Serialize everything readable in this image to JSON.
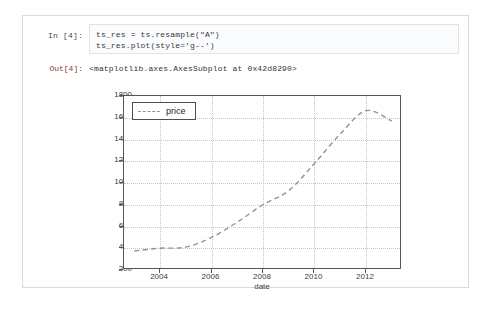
{
  "notebook": {
    "input_prompt": "In [4]:",
    "output_prompt": "Out[4]:",
    "code_line_1": "ts_res = ts.resample(\"A\")",
    "code_line_2": "ts_res.plot(style='g--')",
    "output_text": "<matplotlib.axes.AxesSubplot at 0x42d8290>"
  },
  "chart_data": {
    "type": "line",
    "title": "",
    "xlabel": "date",
    "ylabel": "",
    "legend": [
      "price"
    ],
    "legend_position": "upper-left",
    "grid": true,
    "line_style": "dashed",
    "line_color": "#7f9f86",
    "xlim": [
      2002.6,
      2013.4
    ],
    "ylim": [
      200,
      1800
    ],
    "ytick_labels": [
      "1800",
      "1600",
      "1400",
      "1200",
      "1000",
      "800",
      "600",
      "400",
      "200"
    ],
    "ytick_values": [
      1800,
      1600,
      1400,
      1200,
      1000,
      800,
      600,
      400,
      200
    ],
    "xtick_labels": [
      "2004",
      "2006",
      "2008",
      "2010",
      "2012"
    ],
    "xtick_values": [
      2004,
      2006,
      2008,
      2010,
      2012
    ],
    "series": [
      {
        "name": "price",
        "x": [
          2003,
          2004,
          2005,
          2006,
          2007,
          2008,
          2009,
          2010,
          2011,
          2012,
          2013
        ],
        "values": [
          375,
          400,
          410,
          500,
          640,
          800,
          930,
          1180,
          1450,
          1665,
          1570
        ]
      }
    ]
  }
}
